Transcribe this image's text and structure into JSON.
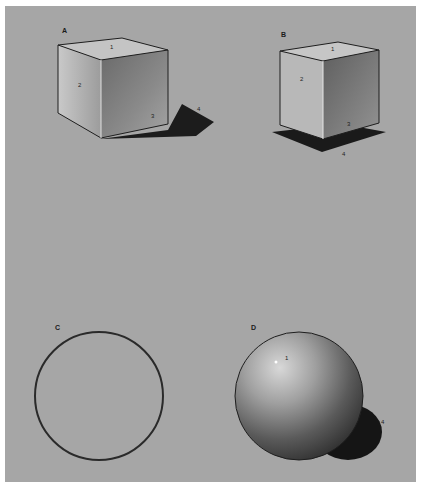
{
  "figures": {
    "A": {
      "label": "A",
      "numbers": [
        "1",
        "2",
        "3",
        "4"
      ]
    },
    "B": {
      "label": "B",
      "numbers": [
        "1",
        "2",
        "3",
        "4"
      ]
    },
    "C": {
      "label": "C"
    },
    "D": {
      "label": "D",
      "numbers": [
        "1",
        "4"
      ]
    }
  },
  "colors": {
    "background": "#a6a6a6",
    "page": "#ffffff",
    "line": "#1e1e1e"
  }
}
